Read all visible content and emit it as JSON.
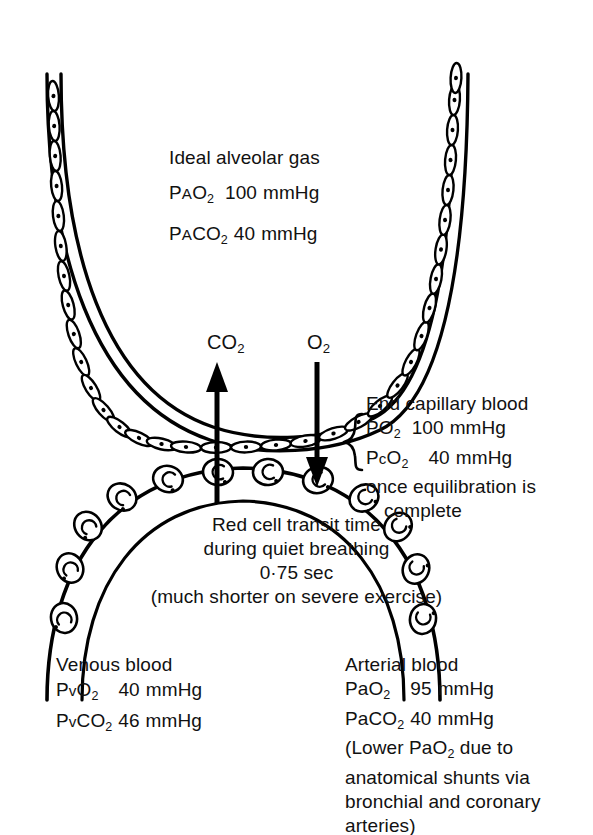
{
  "figure": {
    "title_semantic": "alveolar-capillary gas exchange diagram",
    "background_color": "#ffffff",
    "ink_color": "#000000"
  },
  "alveolar_gas": {
    "heading": "Ideal alveolar gas",
    "po2": {
      "prefix": "P",
      "small_caps": "A",
      "species": "O",
      "sub": "2",
      "value": "100",
      "unit": "mmHg"
    },
    "pco2": {
      "prefix": "P",
      "small_caps": "A",
      "species": "CO",
      "sub": "2",
      "value": "40",
      "unit": "mmHg"
    }
  },
  "arrows": {
    "co2": {
      "label_main": "CO",
      "label_sub": "2",
      "direction": "up"
    },
    "o2": {
      "label_main": "O",
      "label_sub": "2",
      "direction": "down"
    }
  },
  "end_capillary": {
    "heading": "End capillary blood",
    "po2": {
      "prefix": "PO",
      "sub": "2",
      "value": "100",
      "unit": "mmHg"
    },
    "pco2": {
      "prefix": "P",
      "small_caps": "c",
      "species": "O",
      "sub": "2",
      "value": "40",
      "unit": "mmHg"
    },
    "note_line1": "once equilibration is",
    "note_line2": "complete"
  },
  "transit": {
    "line1": "Red cell transit time",
    "line2": "during quiet breathing",
    "line3": "0·75 sec",
    "line4": "(much shorter on severe exercise)"
  },
  "venous": {
    "heading": "Venous blood",
    "po2": {
      "prefix": "P",
      "small_caps": "v",
      "species": "O",
      "sub": "2",
      "value": "40",
      "unit": "mmHg"
    },
    "pco2": {
      "prefix": "P",
      "small_caps": "v",
      "species": "CO",
      "sub": "2",
      "value": "46",
      "unit": "mmHg"
    }
  },
  "arterial": {
    "heading": "Arterial blood",
    "po2": {
      "prefix": "PaO",
      "sub": "2",
      "value": "95",
      "unit": "mmHg"
    },
    "pco2": {
      "prefix": "PaCO",
      "sub": "2",
      "value": "40",
      "unit": "mmHg"
    },
    "note_line1_a": "(Lower PaO",
    "note_line1_sub": "2",
    "note_line1_b": " due to",
    "note_line2": "anatomical shunts via",
    "note_line3": "bronchial and coronary",
    "note_line4": "arteries)"
  }
}
